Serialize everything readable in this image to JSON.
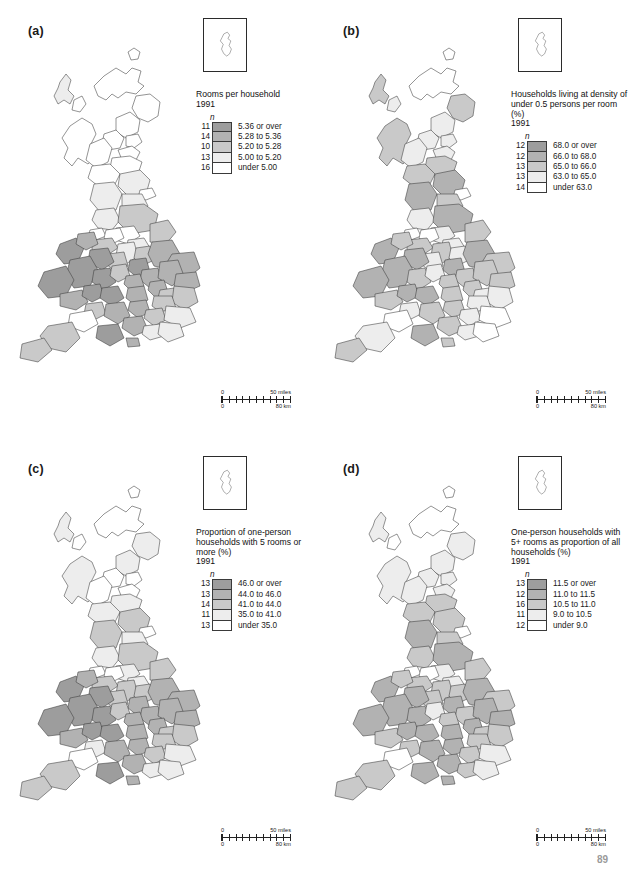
{
  "page": {
    "number": "89",
    "background": "#ffffff"
  },
  "shades": {
    "class1": "#9d9d9d",
    "class2": "#b2b2b2",
    "class3": "#c9c9c9",
    "class4": "#ededed",
    "class5": "#ffffff",
    "outline": "#3a3a3a"
  },
  "scalebar": {
    "miles_zero": "0",
    "miles_max": "50 miles",
    "km_zero": "0",
    "km_max": "80 km"
  },
  "panels": [
    {
      "id": "a",
      "label": "(a)",
      "title": "Rooms per household",
      "year": "1991",
      "n_symbol": "n",
      "classes": [
        {
          "count": "11",
          "label": "5.36 or over",
          "shade": "#9d9d9d"
        },
        {
          "count": "14",
          "label": "5.28 to 5.36",
          "shade": "#b2b2b2"
        },
        {
          "count": "10",
          "label": "5.20 to 5.28",
          "shade": "#c9c9c9"
        },
        {
          "count": "13",
          "label": "5.00 to 5.20",
          "shade": "#ededed"
        },
        {
          "count": "16",
          "label": "under 5.00",
          "shade": "#ffffff"
        }
      ]
    },
    {
      "id": "b",
      "label": "(b)",
      "title": "Households living at density of under 0.5 persons per room (%)",
      "year": "1991",
      "n_symbol": "n",
      "classes": [
        {
          "count": "12",
          "label": "68.0 or over",
          "shade": "#9d9d9d"
        },
        {
          "count": "12",
          "label": "66.0 to 68.0",
          "shade": "#b2b2b2"
        },
        {
          "count": "13",
          "label": "65.0 to 66.0",
          "shade": "#c9c9c9"
        },
        {
          "count": "13",
          "label": "63.0 to 65.0",
          "shade": "#ededed"
        },
        {
          "count": "14",
          "label": "under 63.0",
          "shade": "#ffffff"
        }
      ]
    },
    {
      "id": "c",
      "label": "(c)",
      "title": "Proportion of one-person households with 5 rooms or more (%)",
      "year": "1991",
      "n_symbol": "n",
      "classes": [
        {
          "count": "13",
          "label": "46.0 or over",
          "shade": "#9d9d9d"
        },
        {
          "count": "13",
          "label": "44.0 to 46.0",
          "shade": "#b2b2b2"
        },
        {
          "count": "14",
          "label": "41.0 to 44.0",
          "shade": "#c9c9c9"
        },
        {
          "count": "11",
          "label": "35.0 to 41.0",
          "shade": "#ededed"
        },
        {
          "count": "13",
          "label": "under 35.0",
          "shade": "#ffffff"
        }
      ]
    },
    {
      "id": "d",
      "label": "(d)",
      "title": "One-person households with 5+ rooms as proportion of all households (%)",
      "year": "1991",
      "n_symbol": "n",
      "classes": [
        {
          "count": "13",
          "label": "11.5 or over",
          "shade": "#9d9d9d"
        },
        {
          "count": "12",
          "label": "11.0 to 11.5",
          "shade": "#b2b2b2"
        },
        {
          "count": "16",
          "label": "10.5 to 11.0",
          "shade": "#c9c9c9"
        },
        {
          "count": "11",
          "label": "9.0 to 10.5",
          "shade": "#ededed"
        },
        {
          "count": "12",
          "label": "under 9.0",
          "shade": "#ffffff"
        }
      ]
    }
  ],
  "map": {
    "name": "great-britain-counties-choropleth",
    "inset_name": "shetland-islands-inset"
  },
  "chart_data": {
    "type": "heatmap",
    "panels": [
      {
        "panel": "a",
        "variable": "Rooms per household",
        "year": "1991",
        "class_breaks": [
          5.0,
          5.2,
          5.28,
          5.36
        ],
        "class_labels": [
          "5.36 or over",
          "5.28 to 5.36",
          "5.20 to 5.28",
          "5.00 to 5.20",
          "under 5.00"
        ],
        "class_counts": [
          11,
          14,
          10,
          13,
          16
        ],
        "class_shades": [
          "#9d9d9d",
          "#b2b2b2",
          "#c9c9c9",
          "#ededed",
          "#ffffff"
        ],
        "total_areas": 64
      },
      {
        "panel": "b",
        "variable": "Households living at density of under 0.5 persons per room (%)",
        "year": "1991",
        "class_breaks": [
          63.0,
          65.0,
          66.0,
          68.0
        ],
        "class_labels": [
          "68.0 or over",
          "66.0 to 68.0",
          "65.0 to 66.0",
          "63.0 to 65.0",
          "under 63.0"
        ],
        "class_counts": [
          12,
          12,
          13,
          13,
          14
        ],
        "class_shades": [
          "#9d9d9d",
          "#b2b2b2",
          "#c9c9c9",
          "#ededed",
          "#ffffff"
        ],
        "total_areas": 64
      },
      {
        "panel": "c",
        "variable": "Proportion of one-person households with 5 rooms or more (%)",
        "year": "1991",
        "class_breaks": [
          35.0,
          41.0,
          44.0,
          46.0
        ],
        "class_labels": [
          "46.0 or over",
          "44.0 to 46.0",
          "41.0 to 44.0",
          "35.0 to 41.0",
          "under 35.0"
        ],
        "class_counts": [
          13,
          13,
          14,
          11,
          13
        ],
        "class_shades": [
          "#9d9d9d",
          "#b2b2b2",
          "#c9c9c9",
          "#ededed",
          "#ffffff"
        ],
        "total_areas": 64
      },
      {
        "panel": "d",
        "variable": "One-person households with 5+ rooms as proportion of all households (%)",
        "year": "1991",
        "class_breaks": [
          9.0,
          10.5,
          11.0,
          11.5
        ],
        "class_labels": [
          "11.5 or over",
          "11.0 to 11.5",
          "10.5 to 11.0",
          "9.0 to 10.5",
          "under 9.0"
        ],
        "class_counts": [
          13,
          12,
          16,
          11,
          12
        ],
        "class_shades": [
          "#9d9d9d",
          "#b2b2b2",
          "#c9c9c9",
          "#ededed",
          "#ffffff"
        ],
        "total_areas": 64
      }
    ],
    "scale": {
      "miles": [
        0,
        50
      ],
      "km": [
        0,
        80
      ]
    },
    "legend_position": "upper-right of each panel",
    "grid": false
  }
}
